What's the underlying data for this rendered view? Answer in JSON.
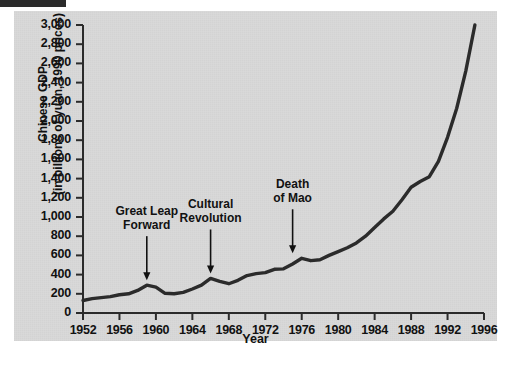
{
  "figure": {
    "background_color": "#d9d9d9",
    "line_color": "#2b2b2b",
    "text_color": "#111111"
  },
  "axes": {
    "ylabel_line1": "Chinese GDP",
    "ylabel_line2": "(in billions of yuan, 1990 prices)",
    "xlabel": "Year",
    "yticks": [
      "3,000",
      "2,800",
      "2,600",
      "2,400",
      "2,200",
      "2,000",
      "1,800",
      "1,600",
      "1,400",
      "1,200",
      "1,000",
      "800",
      "600",
      "400",
      "200",
      "0"
    ],
    "xticks": [
      "1952",
      "1956",
      "1960",
      "1964",
      "1968",
      "1972",
      "1976",
      "1980",
      "1984",
      "1988",
      "1992",
      "1996"
    ]
  },
  "annotations": [
    {
      "id": "great-leap-forward",
      "text": "Great Leap\nForward",
      "year": 1959,
      "value": 290
    },
    {
      "id": "cultural-revolution",
      "text": "Cultural\nRevolution",
      "year": 1966,
      "value": 360
    },
    {
      "id": "death-of-mao",
      "text": "Death\nof Mao",
      "year": 1975,
      "value": 570
    }
  ],
  "chart_data": {
    "type": "line",
    "title": "",
    "xlabel": "Year",
    "ylabel": "Chinese GDP (in billions of yuan, 1990 prices)",
    "xlim": [
      1952,
      1996
    ],
    "ylim": [
      0,
      3000
    ],
    "ytick_interval": 200,
    "xtick_interval": 4,
    "grid": false,
    "legend": null,
    "x": [
      1952,
      1953,
      1954,
      1955,
      1956,
      1957,
      1958,
      1959,
      1960,
      1961,
      1962,
      1963,
      1964,
      1965,
      1966,
      1967,
      1968,
      1969,
      1970,
      1971,
      1972,
      1973,
      1974,
      1975,
      1976,
      1977,
      1978,
      1979,
      1980,
      1981,
      1982,
      1983,
      1984,
      1985,
      1986,
      1987,
      1988,
      1989,
      1990,
      1991,
      1992,
      1993,
      1994,
      1995
    ],
    "values": [
      130,
      150,
      160,
      170,
      190,
      200,
      235,
      290,
      270,
      205,
      200,
      215,
      250,
      290,
      360,
      330,
      305,
      340,
      390,
      410,
      420,
      455,
      460,
      510,
      570,
      545,
      555,
      600,
      640,
      680,
      730,
      800,
      890,
      980,
      1060,
      1180,
      1310,
      1370,
      1420,
      1580,
      1830,
      2130,
      2520,
      3000
    ]
  }
}
